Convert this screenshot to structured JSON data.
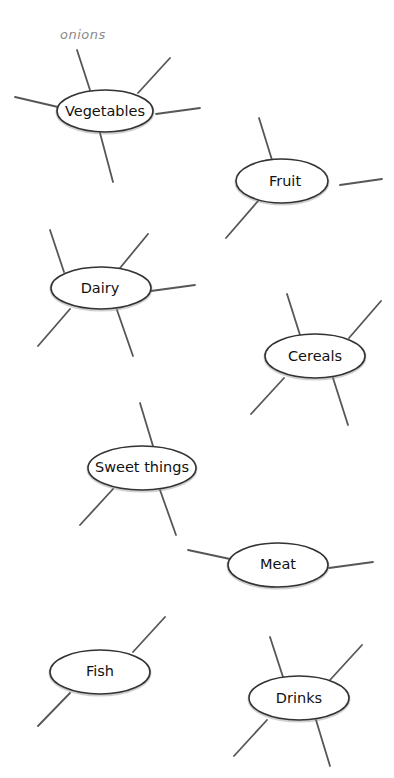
{
  "diagram": {
    "type": "spider-diagrams",
    "annotations": [
      {
        "text": "onions",
        "attached_to": "Vegetables"
      }
    ],
    "nodes": [
      {
        "id": "vegetables",
        "label": "Vegetables",
        "branches": 5
      },
      {
        "id": "fruit",
        "label": "Fruit",
        "branches": 3
      },
      {
        "id": "dairy",
        "label": "Dairy",
        "branches": 5
      },
      {
        "id": "cereals",
        "label": "Cereals",
        "branches": 4
      },
      {
        "id": "sweet-things",
        "label": "Sweet things",
        "branches": 3
      },
      {
        "id": "meat",
        "label": "Meat",
        "branches": 2
      },
      {
        "id": "fish",
        "label": "Fish",
        "branches": 2
      },
      {
        "id": "drinks",
        "label": "Drinks",
        "branches": 4
      }
    ]
  }
}
